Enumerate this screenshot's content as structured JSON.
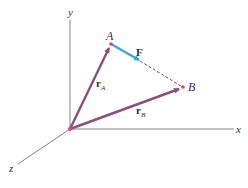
{
  "diagram": {
    "colors": {
      "axis": "#555555",
      "position_vector": "#8a4f7d",
      "force": "#3aa7d6",
      "point": "#e0426a",
      "dashed": "#333333",
      "background": "#ffffff"
    },
    "axes": {
      "x_label": "x",
      "y_label": "y",
      "z_label": "z"
    },
    "points": {
      "origin": {
        "x": 70,
        "y": 129
      },
      "A": {
        "label": "A",
        "x": 111,
        "y": 44
      },
      "B": {
        "label": "B",
        "x": 183,
        "y": 87
      }
    },
    "vectors": {
      "rA": {
        "label_main": "r",
        "label_sub": "A"
      },
      "rB": {
        "label_main": "r",
        "label_sub": "B"
      },
      "F": {
        "label": "F"
      }
    }
  }
}
